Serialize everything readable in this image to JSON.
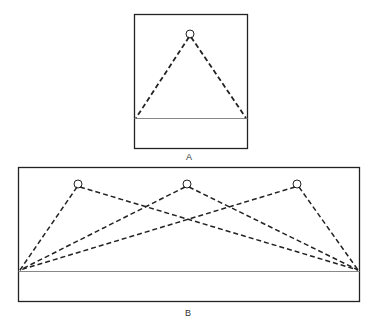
{
  "panels": [
    {
      "id": "A",
      "label": "A",
      "sources": [
        {
          "name": "top-center"
        }
      ],
      "description": "single source at top center with dashed rays to both ends of baseline"
    },
    {
      "id": "B",
      "label": "B",
      "sources": [
        {
          "name": "left"
        },
        {
          "name": "center"
        },
        {
          "name": "right"
        }
      ],
      "description": "three sources along the top each with dashed rays to both ends of baseline"
    }
  ],
  "colors": {
    "stroke": "#222222",
    "baseline": "#888888",
    "background": "#ffffff"
  }
}
